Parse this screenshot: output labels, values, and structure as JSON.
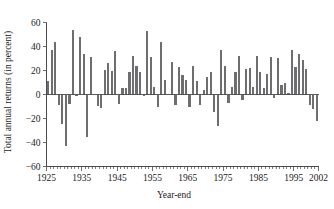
{
  "chart_data": {
    "type": "bar",
    "title": "",
    "subtitle": "",
    "xlabel": "Year-end",
    "ylabel": "Total annual returns (in percent)",
    "xlim": [
      1925,
      2002
    ],
    "ylim": [
      -60,
      60
    ],
    "grid": false,
    "legend": null,
    "bar_color": "#6e6e70",
    "axis_color": "#4a4a4a",
    "text_color": "#1b1b1b",
    "yticks": [
      -60,
      -40,
      -20,
      0,
      20,
      40,
      60
    ],
    "ytick_labels": [
      "−60",
      "−40",
      "−20",
      "0",
      "20",
      "40",
      "60"
    ],
    "xticks": [
      1925,
      1935,
      1945,
      1955,
      1965,
      1975,
      1985,
      1995,
      2002
    ],
    "xtick_labels": [
      "1925",
      "1935",
      "1945",
      "1955",
      "1965",
      "1975",
      "1985",
      "1995",
      "2002"
    ],
    "xtick_minor_step": 1,
    "categories": [
      1926,
      1927,
      1928,
      1929,
      1930,
      1931,
      1932,
      1933,
      1934,
      1935,
      1936,
      1937,
      1938,
      1939,
      1940,
      1941,
      1942,
      1943,
      1944,
      1945,
      1946,
      1947,
      1948,
      1949,
      1950,
      1951,
      1952,
      1953,
      1954,
      1955,
      1956,
      1957,
      1958,
      1959,
      1960,
      1961,
      1962,
      1963,
      1964,
      1965,
      1966,
      1967,
      1968,
      1969,
      1970,
      1971,
      1972,
      1973,
      1974,
      1975,
      1976,
      1977,
      1978,
      1979,
      1980,
      1981,
      1982,
      1983,
      1984,
      1985,
      1986,
      1987,
      1988,
      1989,
      1990,
      1991,
      1992,
      1993,
      1994,
      1995,
      1996,
      1997,
      1998,
      1999,
      2000,
      2001,
      2002
    ],
    "values": [
      11.6,
      37.5,
      43.6,
      -8.4,
      -24.9,
      -43.3,
      -8.2,
      54.0,
      -1.4,
      47.7,
      33.9,
      -35.0,
      31.1,
      -0.4,
      -9.8,
      -11.6,
      20.3,
      25.9,
      19.8,
      36.4,
      -8.1,
      5.7,
      5.5,
      18.8,
      31.7,
      24.0,
      18.4,
      -1.0,
      52.6,
      31.6,
      6.6,
      -10.8,
      43.4,
      12.0,
      0.5,
      26.9,
      -8.7,
      22.8,
      16.5,
      12.5,
      -10.1,
      24.0,
      11.1,
      -8.5,
      4.0,
      14.3,
      19.0,
      -14.7,
      -26.5,
      37.2,
      23.8,
      -7.2,
      6.6,
      18.4,
      32.4,
      -4.9,
      21.4,
      22.5,
      6.3,
      32.2,
      18.5,
      5.2,
      16.8,
      31.5,
      -3.2,
      30.5,
      7.7,
      10.0,
      1.3,
      37.4,
      23.1,
      33.4,
      28.6,
      21.0,
      -9.1,
      -11.9,
      -22.1
    ]
  }
}
